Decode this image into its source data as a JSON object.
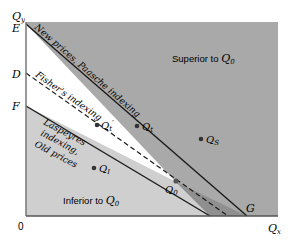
{
  "diagram": {
    "axes": {
      "y_label": "Q",
      "y_sub": "y",
      "x_label": "Q",
      "x_sub": "x",
      "origin_label": "0",
      "y_ticks": [
        "E",
        "D",
        "F"
      ],
      "x_tick": "G"
    },
    "regions": {
      "superior": {
        "text": "Superior to ",
        "q": "Q",
        "sub": "0"
      },
      "inferior": {
        "text": "Inferior to ",
        "q": "Q",
        "sub": "0"
      }
    },
    "lines": {
      "paasche": "New prices, Paasche indexing",
      "fisher": "Fisher's indexing",
      "laspeyres_1": "Laspeyres",
      "laspeyres_2": "indexing,",
      "laspeyres_3": "Old prices"
    },
    "points": [
      {
        "id": "q0",
        "q": "Q",
        "sub": "0"
      },
      {
        "id": "qt",
        "q": "Q",
        "sub": "t"
      },
      {
        "id": "qt_prime",
        "q": "Q",
        "sub": "t",
        "prime": "′"
      },
      {
        "id": "qs",
        "q": "Q",
        "sub": "S"
      },
      {
        "id": "qi",
        "q": "Q",
        "sub": "I"
      }
    ],
    "colors": {
      "superior": "#a9a9a9",
      "inferior": "#cfcfcf",
      "between": "#ffffff",
      "wedge_lower": "#8f8f8f",
      "line": "#1a1a1a"
    }
  }
}
